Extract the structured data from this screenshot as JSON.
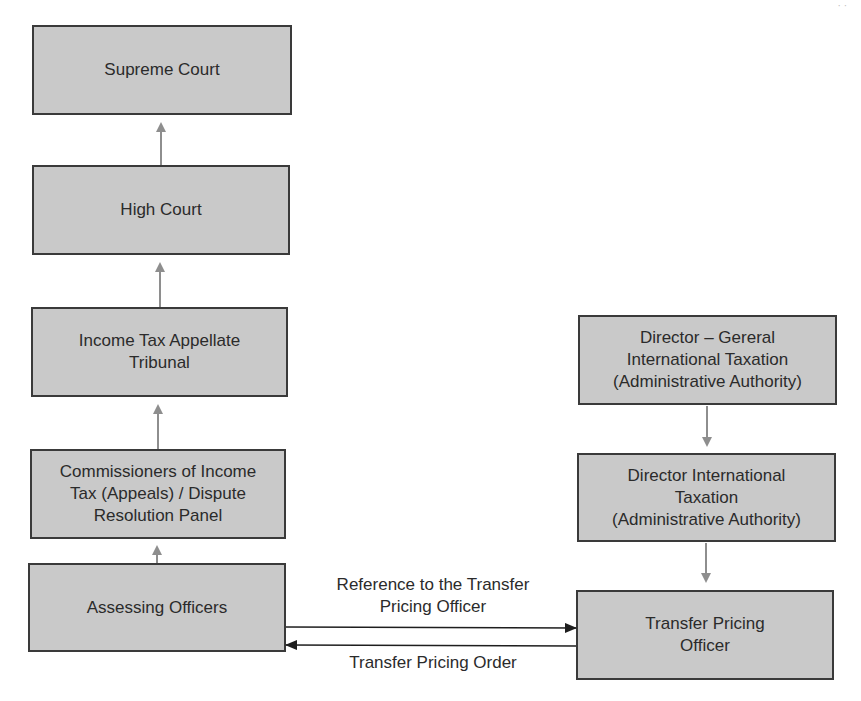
{
  "diagram": {
    "page_mark": "· ·",
    "left_column": [
      {
        "id": "supreme-court",
        "lines": [
          "Supreme Court"
        ]
      },
      {
        "id": "high-court",
        "lines": [
          "High Court"
        ]
      },
      {
        "id": "itat",
        "lines": [
          "Income Tax Appellate",
          "Tribunal"
        ]
      },
      {
        "id": "cita-drp",
        "lines": [
          "Commissioners of Income",
          "Tax (Appeals) / Dispute",
          "Resolution Panel"
        ]
      },
      {
        "id": "assessing-officers",
        "lines": [
          "Assessing Officers"
        ]
      }
    ],
    "right_column": [
      {
        "id": "dg-international-taxation",
        "lines": [
          "Director – Gereral",
          "International Taxation",
          "(Administrative Authority)"
        ]
      },
      {
        "id": "director-international-taxation",
        "lines": [
          "Director International",
          "Taxation",
          "(Administrative Authority)"
        ]
      },
      {
        "id": "transfer-pricing-officer",
        "lines": [
          "Transfer Pricing",
          "Officer"
        ]
      }
    ],
    "edge_labels": {
      "reference": [
        "Reference to the Transfer",
        "Pricing Officer"
      ],
      "order": "Transfer Pricing Order"
    },
    "colors": {
      "box_fill": "#c9c9c9",
      "box_border": "#3a3a3a",
      "hierarchy_arrow": "#8e8e8e",
      "flow_arrow": "#1e1e1e"
    }
  }
}
